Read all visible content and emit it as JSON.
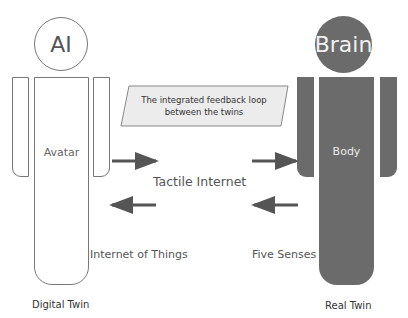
{
  "digital_twin": {
    "head_label": "AI",
    "body_label": "Avatar",
    "caption": "Digital Twin",
    "outline_color": "#777777",
    "fill_color": "#ffffff"
  },
  "real_twin": {
    "head_label": "Brain",
    "body_label": "Body",
    "caption": "Real Twin",
    "fill_color": "#6b6b6b"
  },
  "callout": {
    "line1": "The integrated feedback loop",
    "line2": "between the twins",
    "fill_color": "#ececec"
  },
  "connections": {
    "middle_label": "Tactile Internet",
    "left_label": "Internet of Things",
    "right_label": "Five Senses",
    "arrows": [
      {
        "direction": "right",
        "from": "Avatar",
        "to": "link"
      },
      {
        "direction": "right",
        "from": "link",
        "to": "Body"
      },
      {
        "direction": "left",
        "from": "link",
        "to": "Avatar"
      },
      {
        "direction": "left",
        "from": "Body",
        "to": "link"
      }
    ],
    "arrow_color": "#555555"
  }
}
